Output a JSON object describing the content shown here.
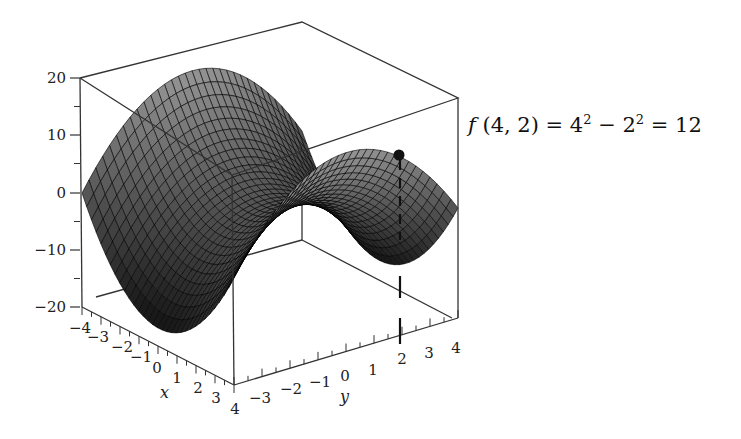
{
  "chart_data": {
    "type": "surface3d",
    "title": "",
    "function": "f(x, y) = x^2 - y^2",
    "xlabel": "x",
    "ylabel": "y",
    "zlabel": "",
    "xlim": [
      -4,
      4
    ],
    "ylim": [
      -4,
      4
    ],
    "zlim": [
      -20,
      20
    ],
    "x_ticks": [
      "-4",
      "-3",
      "-2",
      "-1",
      "0",
      "1",
      "2",
      "3",
      "4"
    ],
    "y_ticks": [
      "-3",
      "-2",
      "-1",
      "0",
      "1",
      "2",
      "3",
      "4"
    ],
    "z_ticks": [
      "20",
      "10",
      "0",
      "-10",
      "-20"
    ],
    "grid": false,
    "box": true,
    "highlight_point": {
      "x": 4,
      "y": 2,
      "z": 12
    },
    "annotation": "f (4, 2) = 4^2 - 2^2 = 12",
    "colors": {
      "surface_dark": "#1a1a1a",
      "surface_light": "#8a8a8a",
      "mesh": "#000000",
      "box": "#333333"
    }
  },
  "annotation": {
    "f": "f",
    "args": " (4, 2) = 4",
    "sup1": "2",
    "minus": " − 2",
    "sup2": "2",
    "result": " = 12"
  },
  "axes": {
    "z": [
      {
        "label": "20",
        "y": 78
      },
      {
        "label": "10",
        "y": 135
      },
      {
        "label": "0",
        "y": 193
      },
      {
        "label": "−10",
        "y": 250
      },
      {
        "label": "−20",
        "y": 307
      }
    ],
    "x": [
      {
        "label": "−4",
        "x": 80,
        "y": 333
      },
      {
        "label": "−3",
        "x": 98,
        "y": 342
      },
      {
        "label": "−2",
        "x": 122,
        "y": 352
      },
      {
        "label": "−1",
        "x": 141,
        "y": 362
      },
      {
        "label": "0",
        "x": 157,
        "y": 373
      },
      {
        "label": "1",
        "x": 177,
        "y": 383
      },
      {
        "label": "2",
        "x": 198,
        "y": 393
      },
      {
        "label": "3",
        "x": 216,
        "y": 403
      },
      {
        "label": "4",
        "x": 235,
        "y": 414
      }
    ],
    "y": [
      {
        "label": "−3",
        "x": 260,
        "y": 403
      },
      {
        "label": "−2",
        "x": 291,
        "y": 394
      },
      {
        "label": "−1",
        "x": 320,
        "y": 387
      },
      {
        "label": "0",
        "x": 345,
        "y": 381
      },
      {
        "label": "1",
        "x": 373,
        "y": 375
      },
      {
        "label": "2",
        "x": 402,
        "y": 364
      },
      {
        "label": "3",
        "x": 429,
        "y": 358
      },
      {
        "label": "4",
        "x": 456,
        "y": 353
      }
    ],
    "xname": "x",
    "yname": "y"
  }
}
